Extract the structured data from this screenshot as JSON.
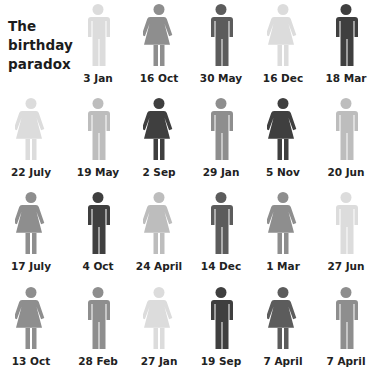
{
  "title": [
    "The",
    "birthday",
    "paradox"
  ],
  "shades": {
    "vlight": "#dcdcdc",
    "light": "#bdbdbd",
    "mid": "#8e8e8e",
    "dark": "#5c5c5c",
    "darker": "#3f3f3f"
  },
  "people": [
    {
      "label": "3 Jan",
      "gender": "male",
      "shade": "vlight"
    },
    {
      "label": "16 Oct",
      "gender": "female",
      "shade": "mid"
    },
    {
      "label": "30 May",
      "gender": "male",
      "shade": "dark"
    },
    {
      "label": "16 Dec",
      "gender": "female",
      "shade": "vlight"
    },
    {
      "label": "18 Mar",
      "gender": "male",
      "shade": "darker"
    },
    {
      "label": "22 July",
      "gender": "female",
      "shade": "vlight"
    },
    {
      "label": "19 May",
      "gender": "male",
      "shade": "light"
    },
    {
      "label": "2 Sep",
      "gender": "female",
      "shade": "darker"
    },
    {
      "label": "29 Jan",
      "gender": "male",
      "shade": "mid"
    },
    {
      "label": "5 Nov",
      "gender": "female",
      "shade": "darker"
    },
    {
      "label": "20 Jun",
      "gender": "male",
      "shade": "light"
    },
    {
      "label": "17 July",
      "gender": "female",
      "shade": "mid"
    },
    {
      "label": "4 Oct",
      "gender": "male",
      "shade": "darker"
    },
    {
      "label": "24 April",
      "gender": "female",
      "shade": "light"
    },
    {
      "label": "14 Dec",
      "gender": "male",
      "shade": "dark"
    },
    {
      "label": "1 Mar",
      "gender": "female",
      "shade": "mid"
    },
    {
      "label": "27 Jun",
      "gender": "male",
      "shade": "vlight"
    },
    {
      "label": "13 Oct",
      "gender": "female",
      "shade": "mid"
    },
    {
      "label": "28 Feb",
      "gender": "male",
      "shade": "mid"
    },
    {
      "label": "27 Jan",
      "gender": "female",
      "shade": "vlight"
    },
    {
      "label": "19 Sep",
      "gender": "male",
      "shade": "darker"
    },
    {
      "label": "7 April",
      "gender": "female",
      "shade": "dark"
    },
    {
      "label": "7 April",
      "gender": "male",
      "shade": "mid"
    }
  ]
}
